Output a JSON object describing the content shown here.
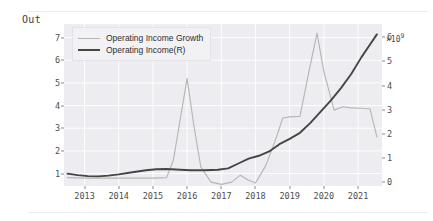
{
  "notebook": {
    "output_label": "Out"
  },
  "chart_data": {
    "type": "line",
    "title": "",
    "xlabel": "",
    "ylabel": "",
    "grid": true,
    "legend_position": "upper left",
    "xlim": [
      2012.4,
      2021.7
    ],
    "xticks": [
      2013,
      2014,
      2015,
      2016,
      2017,
      2018,
      2019,
      2020,
      2021
    ],
    "xticklabels": [
      "2013",
      "2014",
      "2015",
      "2016",
      "2017",
      "2018",
      "2019",
      "2020",
      "2021"
    ],
    "left_axis": {
      "ylim": [
        0.45,
        7.6
      ],
      "yticks": [
        1,
        2,
        3,
        4,
        5,
        6,
        7
      ],
      "yticklabels": [
        "1",
        "2",
        "3",
        "4",
        "5",
        "6",
        "7"
      ]
    },
    "right_axis": {
      "ylim": [
        -0.15,
        6.55
      ],
      "yticks": [
        0,
        1,
        2,
        3,
        4,
        5,
        6
      ],
      "yticklabels": [
        "0",
        "1",
        "2",
        "3",
        "4",
        "5",
        "6"
      ],
      "offset_text": "×10",
      "offset_exponent": "9"
    },
    "series": [
      {
        "name": "Operating Income Growth",
        "axis": "left",
        "color": "#b6b6b6",
        "x": [
          2012.5,
          2013.0,
          2013.5,
          2014.0,
          2014.5,
          2015.0,
          2015.4,
          2015.6,
          2015.8,
          2016.0,
          2016.2,
          2016.4,
          2016.7,
          2017.0,
          2017.3,
          2017.55,
          2017.8,
          2018.0,
          2018.3,
          2018.6,
          2018.8,
          2019.0,
          2019.3,
          2019.55,
          2019.8,
          2020.0,
          2020.3,
          2020.55,
          2020.8,
          2021.1,
          2021.35,
          2021.55
        ],
        "y": [
          0.82,
          0.8,
          0.8,
          0.8,
          0.8,
          0.8,
          0.82,
          1.6,
          3.4,
          5.2,
          3.1,
          1.3,
          0.62,
          0.52,
          0.62,
          0.92,
          0.7,
          0.58,
          1.35,
          2.55,
          3.45,
          3.5,
          3.52,
          5.4,
          7.2,
          5.5,
          3.8,
          3.95,
          3.9,
          3.88,
          3.85,
          2.62
        ]
      },
      {
        "name": "Operating Income(R)",
        "axis": "right",
        "color": "#454545",
        "x": [
          2012.5,
          2012.8,
          2013.1,
          2013.4,
          2013.7,
          2014.0,
          2014.4,
          2014.8,
          2015.1,
          2015.4,
          2015.8,
          2016.1,
          2016.5,
          2016.9,
          2017.2,
          2017.5,
          2017.8,
          2018.1,
          2018.4,
          2018.7,
          2019.0,
          2019.3,
          2019.6,
          2019.9,
          2020.2,
          2020.5,
          2020.8,
          2021.1,
          2021.35,
          2021.55
        ],
        "y": [
          0.36,
          0.3,
          0.26,
          0.25,
          0.28,
          0.33,
          0.42,
          0.5,
          0.54,
          0.55,
          0.52,
          0.5,
          0.5,
          0.52,
          0.58,
          0.78,
          0.98,
          1.1,
          1.28,
          1.58,
          1.8,
          2.05,
          2.45,
          2.92,
          3.38,
          3.9,
          4.48,
          5.18,
          5.7,
          6.12
        ]
      }
    ]
  },
  "legend": {
    "entries": [
      {
        "label": "Operating Income Growth",
        "color": "#b6b6b6"
      },
      {
        "label": "Operating Income(R)",
        "color": "#454545"
      }
    ]
  }
}
